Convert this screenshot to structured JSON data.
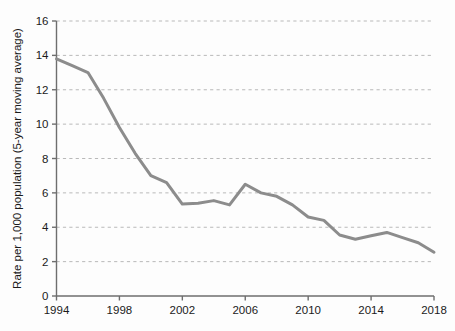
{
  "chart_data": {
    "type": "line",
    "title": "",
    "subtitle": "",
    "xlabel": "",
    "ylabel": "Rate per 1,000 population (5-year moving average)",
    "xlim": [
      1994,
      2018
    ],
    "ylim": [
      0,
      16
    ],
    "xticks": [
      1994,
      1998,
      2002,
      2006,
      2010,
      2014,
      2018
    ],
    "xtick_labels": [
      "1994",
      "1998",
      "2002",
      "2006",
      "2010",
      "2014",
      "2018"
    ],
    "yticks": [
      0,
      2,
      4,
      6,
      8,
      10,
      12,
      14,
      16
    ],
    "ytick_labels": [
      "0",
      "2",
      "4",
      "6",
      "8",
      "10",
      "12",
      "14",
      "16"
    ],
    "grid": "horizontal-dashed",
    "legend": "none",
    "annotations": [],
    "series": [
      {
        "name": "Rate per 1,000 population",
        "color": "#8c8c8c",
        "line_width": 3,
        "x": [
          1994,
          1995,
          1996,
          1997,
          1998,
          1999,
          2000,
          2001,
          2002,
          2003,
          2004,
          2005,
          2006,
          2007,
          2008,
          2009,
          2010,
          2011,
          2012,
          2013,
          2014,
          2015,
          2016,
          2017,
          2018
        ],
        "values": [
          13.8,
          13.4,
          13.0,
          11.5,
          9.8,
          8.3,
          7.0,
          6.6,
          5.35,
          5.4,
          5.55,
          5.3,
          6.5,
          6.0,
          5.8,
          5.3,
          4.6,
          4.4,
          3.55,
          3.3,
          3.5,
          3.7,
          3.4,
          3.1,
          2.55
        ],
        "x_labels": [
          "1994",
          "1995",
          "1996",
          "1997",
          "1998",
          "1999",
          "2000",
          "2001",
          "2002",
          "2003",
          "2004",
          "2005",
          "2006",
          "2007",
          "2008",
          "2009",
          "2010",
          "2011",
          "2012",
          "2013",
          "2014",
          "2015",
          "2016",
          "2017",
          "2018"
        ]
      }
    ]
  },
  "style": {
    "background": "#fdfdfd",
    "axis_color": "#6e6e6e",
    "grid_color": "#b9b9b9",
    "text_color": "#1b1b1b",
    "line_color": "#8c8c8c"
  }
}
